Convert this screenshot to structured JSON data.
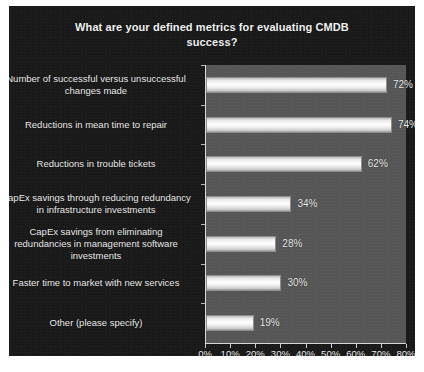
{
  "chart_data": {
    "type": "bar",
    "orientation": "horizontal",
    "title": "What are your defined metrics for evaluating CMDB success?",
    "title_line1": "What are your defined metrics for evaluating CMDB",
    "title_line2": "success?",
    "xlabel": "",
    "ylabel": "",
    "xlim": [
      0,
      80
    ],
    "grid": false,
    "legend": null,
    "categories": [
      "Number of successful versus unsuccessful changes made",
      "Reductions in mean time to repair",
      "Reductions in trouble tickets",
      "CapEx savings through reducing redundancy in infrastructure investments",
      "CapEx savings from eliminating redundancies in management software investments",
      "Faster time to market with new services",
      "Other (please specify)"
    ],
    "values": [
      72,
      74,
      62,
      34,
      28,
      30,
      19
    ],
    "value_labels": [
      "72%",
      "74%",
      "62%",
      "34%",
      "28%",
      "30%",
      "19%"
    ],
    "xticks": [
      0,
      10,
      20,
      30,
      40,
      50,
      60,
      70,
      80
    ],
    "xtick_labels": [
      "0%",
      "10%",
      "20%",
      "30%",
      "40%",
      "50%",
      "60%",
      "70%",
      "80%"
    ]
  },
  "colors": {
    "panel_background": "#1a1a1a",
    "plot_background": "#565656",
    "bar_fill": "#ffffff",
    "text": "#ededed",
    "axis": "#d8d8d8"
  }
}
